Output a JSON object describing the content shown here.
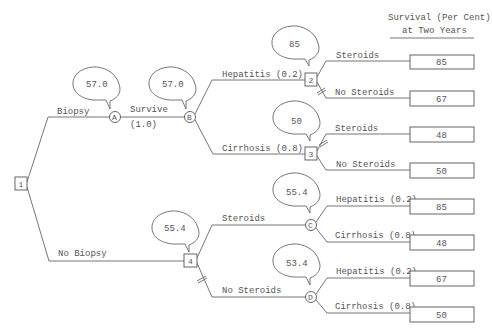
{
  "header": {
    "line1": "Survival (Per Cent)",
    "line2": "at Two Years"
  },
  "decision_nodes": {
    "n1": "1",
    "n2": "2",
    "n3": "3",
    "n4": "4"
  },
  "chance_nodes": {
    "A": "A",
    "B": "B",
    "C": "C",
    "D": "D"
  },
  "branches": {
    "biopsy": "Biopsy",
    "no_biopsy": "No Biopsy",
    "survive": "Survive",
    "survive_prob": "(1.0)",
    "b_hepatitis": "Hepatitis (0.2)",
    "b_cirrhosis": "Cirrhosis (0.8)",
    "n2_steroids": "Steroids",
    "n2_no_steroids": "No Steroids",
    "n3_steroids": "Steroids",
    "n3_no_steroids": "No Steroids",
    "n4_steroids": "Steroids",
    "n4_no_steroids": "No Steroids",
    "c_hepatitis": "Hepatitis (0.2)",
    "c_cirrhosis": "Cirrhosis (0.8)",
    "d_hepatitis": "Hepatitis (0.2)",
    "d_cirrhosis": "Cirrhosis (0.8)"
  },
  "expected_values": {
    "A": "57.0",
    "B": "57.0",
    "n2": "85",
    "n3": "50",
    "n4": "55.4",
    "C": "55.4",
    "D": "53.4"
  },
  "outcomes": {
    "hep_steroids": "85",
    "hep_no_steroids": "67",
    "cir_steroids": "48",
    "cir_no_steroids": "50",
    "c_hepatitis": "85",
    "c_cirrhosis": "48",
    "d_hepatitis": "67",
    "d_cirrhosis": "50"
  }
}
